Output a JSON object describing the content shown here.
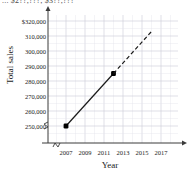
{
  "cut_title": "...  $2??,???; $3??,???",
  "chart_data": {
    "type": "line",
    "title": "",
    "xlabel": "Year",
    "ylabel": "Total sales",
    "xlim": [
      2006,
      2018
    ],
    "ylim": [
      245000,
      322000
    ],
    "grid": true,
    "legend": "none",
    "axis_break_x": true,
    "axis_break_y": true,
    "y_ticks": [
      "250,000",
      "260,000",
      "270,000",
      "280,000",
      "290,000",
      "300,000",
      "310,000",
      "$320,000"
    ],
    "y_tick_values": [
      250000,
      260000,
      270000,
      280000,
      290000,
      300000,
      310000,
      320000
    ],
    "x_ticks": [
      "2007",
      "2009",
      "2011",
      "2013",
      "2015",
      "2017"
    ],
    "x_tick_values": [
      2007,
      2009,
      2011,
      2013,
      2015,
      2017
    ],
    "series": [
      {
        "name": "observed",
        "style": "solid",
        "markers": true,
        "x": [
          2007,
          2012
        ],
        "values": [
          250000,
          285000
        ]
      },
      {
        "name": "projected",
        "style": "dashed",
        "markers": false,
        "x": [
          2012,
          2016
        ],
        "values": [
          285000,
          313000
        ]
      }
    ],
    "colors": {
      "line": "#1a1a1a",
      "marker": "#000000",
      "grid_major": "#c9c9d6",
      "grid_minor": "#e4e4ec",
      "axis": "#3a3a3a"
    }
  }
}
